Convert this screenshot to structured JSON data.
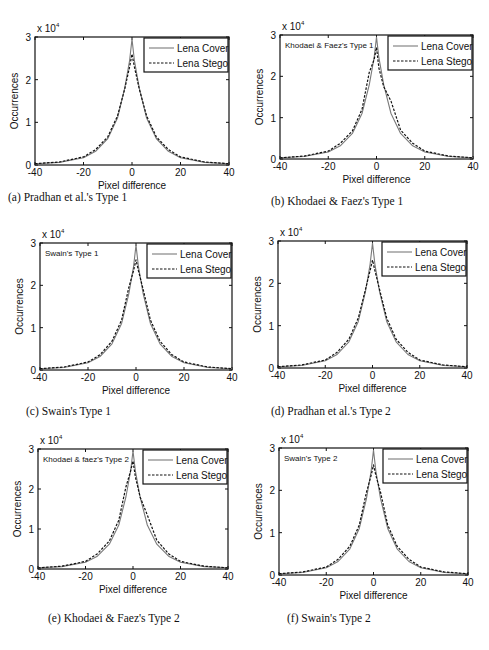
{
  "figure": {
    "x_label": "Pixel difference",
    "y_label": "Occurrences",
    "y_multiplier": "x 10",
    "y_multiplier_exp": "4",
    "x_ticks": [
      "-40",
      "-20",
      "0",
      "20",
      "40"
    ],
    "y_ticks": [
      "0",
      "1",
      "2",
      "3"
    ],
    "legend": {
      "cover": "Lena Cover",
      "stego": "Lena Stego"
    },
    "colors": {
      "cover": "#7a7a7a",
      "stego": "#111111",
      "axis": "#111111"
    }
  },
  "panels": [
    {
      "id": "a",
      "caption": "(a)  Pradhan et al.'s Type 1",
      "inset": ""
    },
    {
      "id": "b",
      "caption": "(b)  Khodaei & Faez's Type 1",
      "inset": "Khodaei & Faez's Type 1"
    },
    {
      "id": "c",
      "caption": "(c)  Swain's Type 1",
      "inset": "Swain's Type 1"
    },
    {
      "id": "d",
      "caption": "(d)  Pradhan et al.'s Type 2",
      "inset": ""
    },
    {
      "id": "e",
      "caption": "(e)  Khodaei & Faez's Type 2",
      "inset": "Khodaei & faez's Type 2"
    },
    {
      "id": "f",
      "caption": "(f)  Swain's Type 2",
      "inset": "Swain's Type 2"
    }
  ],
  "chart_data": [
    {
      "type": "line",
      "title": "(a) Pradhan et al.'s Type 1",
      "xlabel": "Pixel difference",
      "ylabel": "Occurrences (x 10^4)",
      "xlim": [
        -40,
        40
      ],
      "ylim": [
        0,
        3
      ],
      "grid": false,
      "legend_position": "upper right",
      "x": [
        -40,
        -30,
        -20,
        -15,
        -10,
        -6,
        -3,
        -1,
        0,
        1,
        3,
        6,
        10,
        15,
        20,
        30,
        40
      ],
      "series": [
        {
          "name": "Lena Cover",
          "values": [
            0.03,
            0.06,
            0.17,
            0.32,
            0.62,
            1.1,
            1.8,
            2.45,
            2.95,
            2.45,
            1.8,
            1.1,
            0.62,
            0.32,
            0.17,
            0.06,
            0.03
          ]
        },
        {
          "name": "Lena Stego",
          "values": [
            0.03,
            0.07,
            0.19,
            0.36,
            0.66,
            1.15,
            1.78,
            2.3,
            2.6,
            2.3,
            1.78,
            1.15,
            0.66,
            0.36,
            0.19,
            0.07,
            0.03
          ]
        }
      ]
    },
    {
      "type": "line",
      "title": "(b) Khodaei & Faez's Type 1",
      "xlabel": "Pixel difference",
      "ylabel": "Occurrences (x 10^4)",
      "xlim": [
        -40,
        40
      ],
      "ylim": [
        0,
        3
      ],
      "grid": false,
      "legend_position": "upper right",
      "annotation": "Khodaei & Faez's Type 1",
      "x": [
        -40,
        -30,
        -20,
        -15,
        -10,
        -6,
        -3,
        -1,
        0,
        1,
        3,
        6,
        10,
        15,
        20,
        30,
        40
      ],
      "series": [
        {
          "name": "Lena Cover",
          "values": [
            0.03,
            0.06,
            0.17,
            0.32,
            0.62,
            1.1,
            1.8,
            2.45,
            2.95,
            2.45,
            1.8,
            1.1,
            0.62,
            0.32,
            0.17,
            0.06,
            0.03
          ]
        },
        {
          "name": "Lena Stego",
          "values": [
            0.03,
            0.07,
            0.19,
            0.38,
            0.68,
            1.2,
            2.1,
            2.4,
            2.7,
            2.2,
            1.75,
            1.4,
            0.7,
            0.38,
            0.19,
            0.07,
            0.03
          ]
        }
      ]
    },
    {
      "type": "line",
      "title": "(c) Swain's Type 1",
      "xlabel": "Pixel difference",
      "ylabel": "Occurrences (x 10^4)",
      "xlim": [
        -40,
        40
      ],
      "ylim": [
        0,
        3
      ],
      "grid": false,
      "legend_position": "upper right",
      "annotation": "Swain's Type 1",
      "x": [
        -40,
        -30,
        -20,
        -15,
        -10,
        -6,
        -3,
        -1,
        0,
        1,
        3,
        6,
        10,
        15,
        20,
        30,
        40
      ],
      "series": [
        {
          "name": "Lena Cover",
          "values": [
            0.03,
            0.06,
            0.17,
            0.32,
            0.62,
            1.1,
            1.8,
            2.45,
            2.95,
            2.45,
            1.8,
            1.1,
            0.62,
            0.32,
            0.17,
            0.06,
            0.03
          ]
        },
        {
          "name": "Lena Stego",
          "values": [
            0.03,
            0.07,
            0.19,
            0.36,
            0.68,
            1.18,
            1.95,
            2.35,
            2.6,
            2.35,
            1.9,
            1.18,
            0.68,
            0.36,
            0.19,
            0.07,
            0.03
          ]
        }
      ]
    },
    {
      "type": "line",
      "title": "(d) Pradhan et al.'s Type 2",
      "xlabel": "Pixel difference",
      "ylabel": "Occurrences (x 10^4)",
      "xlim": [
        -40,
        40
      ],
      "ylim": [
        0,
        3
      ],
      "grid": false,
      "legend_position": "upper right",
      "x": [
        -40,
        -30,
        -20,
        -15,
        -10,
        -6,
        -3,
        -1,
        0,
        1,
        3,
        6,
        10,
        15,
        20,
        30,
        40
      ],
      "series": [
        {
          "name": "Lena Cover",
          "values": [
            0.03,
            0.06,
            0.17,
            0.32,
            0.62,
            1.1,
            1.8,
            2.45,
            2.95,
            2.45,
            1.8,
            1.1,
            0.62,
            0.32,
            0.17,
            0.06,
            0.03
          ]
        },
        {
          "name": "Lena Stego",
          "values": [
            0.03,
            0.07,
            0.19,
            0.37,
            0.68,
            1.18,
            1.85,
            2.3,
            2.55,
            2.3,
            1.85,
            1.18,
            0.68,
            0.37,
            0.19,
            0.07,
            0.03
          ]
        }
      ]
    },
    {
      "type": "line",
      "title": "(e) Khodaei & Faez's Type 2",
      "xlabel": "Pixel difference",
      "ylabel": "Occurrences (x 10^4)",
      "xlim": [
        -40,
        40
      ],
      "ylim": [
        0,
        3
      ],
      "grid": false,
      "legend_position": "upper right",
      "annotation": "Khodaei & faez's Type 2",
      "x": [
        -40,
        -30,
        -20,
        -15,
        -10,
        -6,
        -3,
        -1,
        0,
        1,
        3,
        6,
        10,
        15,
        20,
        30,
        40
      ],
      "series": [
        {
          "name": "Lena Cover",
          "values": [
            0.03,
            0.06,
            0.17,
            0.32,
            0.62,
            1.1,
            1.8,
            2.45,
            2.95,
            2.45,
            1.8,
            1.1,
            0.62,
            0.32,
            0.17,
            0.06,
            0.03
          ]
        },
        {
          "name": "Lena Stego",
          "values": [
            0.03,
            0.07,
            0.19,
            0.38,
            0.7,
            1.22,
            2.05,
            2.45,
            2.7,
            2.3,
            1.8,
            1.35,
            0.72,
            0.38,
            0.19,
            0.07,
            0.03
          ]
        }
      ]
    },
    {
      "type": "line",
      "title": "(f) Swain's Type 2",
      "xlabel": "Pixel difference",
      "ylabel": "Occurrences (x 10^4)",
      "xlim": [
        -40,
        40
      ],
      "ylim": [
        0,
        3
      ],
      "grid": false,
      "legend_position": "upper right",
      "annotation": "Swain's Type 2",
      "x": [
        -40,
        -30,
        -20,
        -15,
        -10,
        -6,
        -3,
        -1,
        0,
        1,
        3,
        6,
        10,
        15,
        20,
        30,
        40
      ],
      "series": [
        {
          "name": "Lena Cover",
          "values": [
            0.03,
            0.06,
            0.17,
            0.32,
            0.62,
            1.1,
            1.8,
            2.45,
            2.95,
            2.45,
            1.8,
            1.1,
            0.62,
            0.32,
            0.17,
            0.06,
            0.03
          ]
        },
        {
          "name": "Lena Stego",
          "values": [
            0.03,
            0.07,
            0.19,
            0.37,
            0.68,
            1.18,
            1.95,
            2.35,
            2.6,
            2.35,
            1.95,
            1.18,
            0.68,
            0.37,
            0.19,
            0.07,
            0.03
          ]
        }
      ]
    }
  ]
}
